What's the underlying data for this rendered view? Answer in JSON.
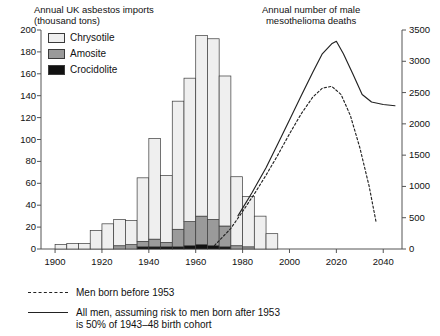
{
  "titles": {
    "left_panel": "Annual UK asbestos imports\n(thousand tons)",
    "right_panel": "Annual number of male\nmesothelioma deaths"
  },
  "axes": {
    "left_ticks": [
      "200",
      "180",
      "160",
      "140",
      "120",
      "100",
      "80",
      "60",
      "40",
      "20",
      "0"
    ],
    "left_values": [
      200,
      180,
      160,
      140,
      120,
      100,
      80,
      60,
      40,
      20,
      0
    ],
    "left_range": [
      0,
      200
    ],
    "right_ticks": [
      "3500",
      "3000",
      "2500",
      "2000",
      "1500",
      "1000",
      "500",
      "0"
    ],
    "right_values": [
      3500,
      3000,
      2500,
      2000,
      1500,
      1000,
      500,
      0
    ],
    "right_range": [
      0,
      3500
    ],
    "x_ticks": [
      "1900",
      "1920",
      "1940",
      "1960",
      "1980",
      "2000",
      "2020",
      "2040"
    ],
    "x_values": [
      1900,
      1920,
      1940,
      1960,
      1980,
      2000,
      2020,
      2040
    ],
    "x_range": [
      1894,
      2048
    ]
  },
  "series_legend": [
    {
      "label": "Chrysotile",
      "color": "#efefef",
      "name": "chrysotile"
    },
    {
      "label": "Amosite",
      "color": "#9a9a9a",
      "name": "amosite"
    },
    {
      "label": "Crocidolite",
      "color": "#111111",
      "name": "crocidolite"
    }
  ],
  "curve_legend": [
    {
      "style": "dashed",
      "label": "Men born before 1953"
    },
    {
      "style": "solid",
      "label": "All men, assuming risk to men born after 1953\nis 50% of 1943–48 birth cohort"
    }
  ],
  "chart_data": {
    "type": "bar",
    "xlabel": "",
    "ylabel": "Annual UK asbestos imports (thousand tons)",
    "ylabel_right": "Annual number of male mesothelioma deaths",
    "ylim": [
      0,
      200
    ],
    "ylim_right": [
      0,
      3500
    ],
    "xlim": [
      1894,
      2048
    ],
    "grid": false,
    "legend_position": "inside-top-left",
    "bar_mode": "stacked",
    "bin_width_years": 5,
    "categories": [
      1900,
      1905,
      1910,
      1915,
      1920,
      1925,
      1930,
      1935,
      1940,
      1945,
      1950,
      1955,
      1960,
      1965,
      1970,
      1975,
      1980,
      1985,
      1990
    ],
    "series": [
      {
        "name": "Chrysotile",
        "color": "#efefef",
        "values": [
          4,
          5,
          5,
          17,
          23,
          24,
          22,
          58,
          92,
          61,
          117,
          131,
          165,
          165,
          137,
          63,
          46,
          30,
          14
        ]
      },
      {
        "name": "Amosite",
        "color": "#9a9a9a",
        "values": [
          0,
          0,
          0,
          0,
          0,
          3,
          4,
          5,
          7,
          4,
          16,
          22,
          26,
          24,
          19,
          3,
          2,
          0,
          0
        ]
      },
      {
        "name": "Crocidolite",
        "color": "#111111",
        "values": [
          0,
          0,
          0,
          0,
          0,
          0,
          0,
          2,
          2,
          2,
          2,
          3,
          4,
          3,
          2,
          0,
          0,
          0,
          0
        ]
      }
    ],
    "stacked_totals": [
      4,
      5,
      5,
      17,
      23,
      27,
      26,
      65,
      101,
      67,
      135,
      156,
      195,
      192,
      158,
      66,
      48,
      30,
      14
    ],
    "curves": [
      {
        "name": "Men born before 1953",
        "style": "dashed",
        "axis": "right",
        "x": [
          1968,
          1975,
          1980,
          1985,
          1990,
          1995,
          2000,
          2005,
          2010,
          2014,
          2018,
          2022,
          2026,
          2030,
          2034,
          2037
        ],
        "y": [
          55,
          330,
          600,
          880,
          1180,
          1500,
          1840,
          2160,
          2430,
          2570,
          2600,
          2470,
          2130,
          1620,
          1000,
          420
        ]
      },
      {
        "name": "All men, assuming risk to men born after 1953 is 50% of 1943–48 birth cohort",
        "style": "solid",
        "axis": "right",
        "x": [
          1978,
          1984,
          1990,
          1995,
          2000,
          2005,
          2010,
          2014,
          2018,
          2020,
          2023,
          2027,
          2031,
          2035,
          2040,
          2045
        ],
        "y": [
          530,
          900,
          1300,
          1680,
          2060,
          2450,
          2830,
          3120,
          3280,
          3320,
          3120,
          2800,
          2470,
          2350,
          2310,
          2290
        ]
      }
    ]
  }
}
